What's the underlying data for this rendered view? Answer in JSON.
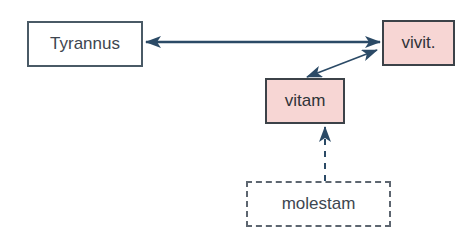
{
  "diagram": {
    "nodes": [
      {
        "id": "tyrannus",
        "label": "Tyrannus",
        "style": "plain"
      },
      {
        "id": "vivit",
        "label": "vivit.",
        "style": "highlighted"
      },
      {
        "id": "vitam",
        "label": "vitam",
        "style": "highlighted"
      },
      {
        "id": "molestam",
        "label": "molestam",
        "style": "dashed"
      }
    ],
    "edges": [
      {
        "from": "tyrannus",
        "to": "vivit",
        "type": "bidirectional",
        "line": "solid"
      },
      {
        "from": "vivit",
        "to": "vitam",
        "type": "bidirectional",
        "line": "solid"
      },
      {
        "from": "molestam",
        "to": "vitam",
        "type": "directed",
        "line": "dashed"
      }
    ],
    "colors": {
      "highlight_fill": "#f7d6d4",
      "arrow": "#2b4a66",
      "border": "#4a5a66"
    }
  }
}
